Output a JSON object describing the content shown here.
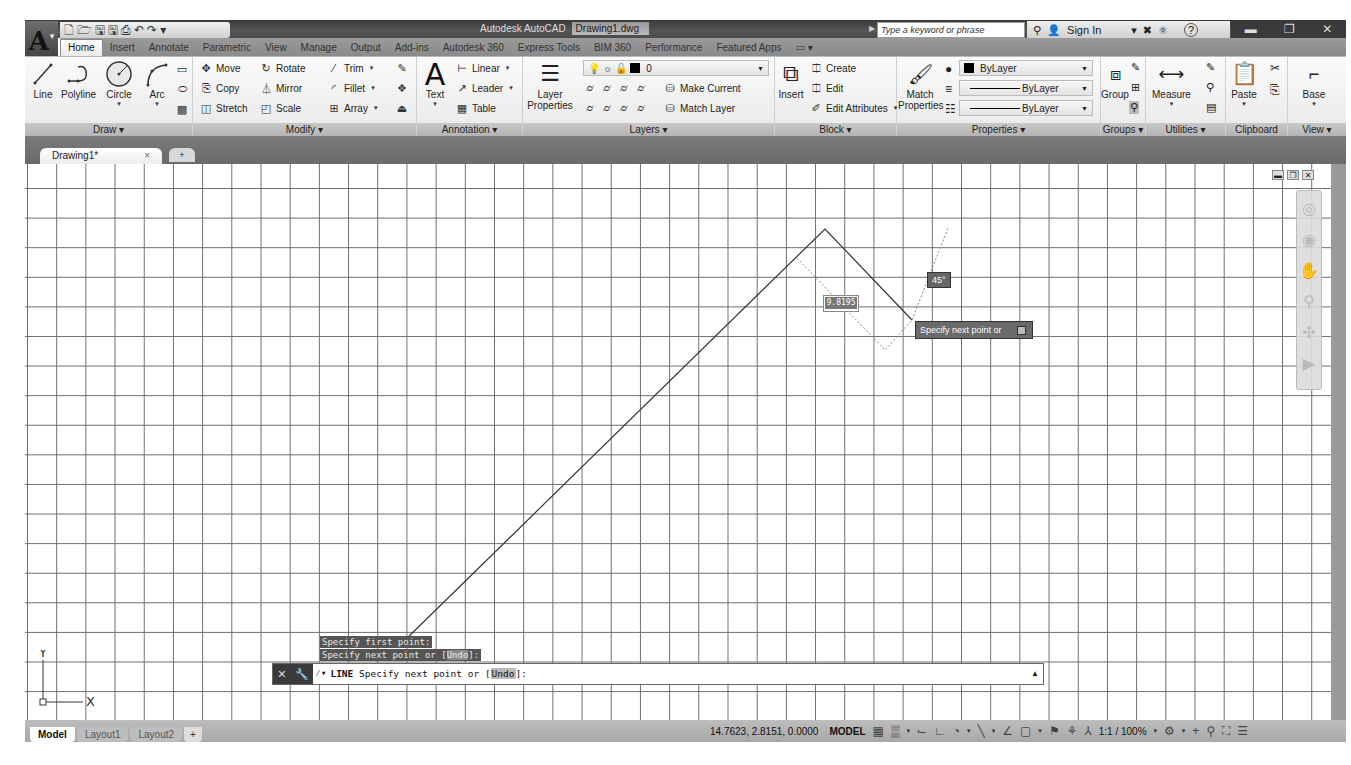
{
  "app": {
    "title": "Autodesk AutoCAD",
    "document": "Drawing1.dwg",
    "logo_letter": "A"
  },
  "quick_access": {
    "icons": [
      "new-icon",
      "open-icon",
      "save-icon",
      "save-as-icon",
      "plot-icon",
      "undo-icon",
      "redo-icon",
      "customize-icon"
    ],
    "glyphs": [
      "🗋",
      "🗁",
      "🖫",
      "🖫",
      "⎙",
      "↶",
      "↷",
      "▾"
    ]
  },
  "search": {
    "placeholder": "Type a keyword or phrase"
  },
  "account": {
    "sign_in": "Sign In",
    "help": "?"
  },
  "ribbon_tabs": [
    "Home",
    "Insert",
    "Annotate",
    "Parametric",
    "View",
    "Manage",
    "Output",
    "Add-ins",
    "Autodesk 360",
    "Express Tools",
    "BIM 360",
    "Performance",
    "Featured Apps"
  ],
  "ribbon": {
    "draw": {
      "title": "Draw ▾",
      "buttons": [
        "Line",
        "Polyline",
        "Circle",
        "Arc"
      ]
    },
    "modify": {
      "title": "Modify ▾",
      "buttons": [
        "Move",
        "Rotate",
        "Trim",
        "Copy",
        "Mirror",
        "Fillet",
        "Stretch",
        "Scale",
        "Array"
      ]
    },
    "annotation": {
      "title": "Annotation ▾",
      "text": "Text",
      "buttons": [
        "Linear",
        "Leader",
        "Table"
      ]
    },
    "layers": {
      "title": "Layers ▾",
      "layer_properties": "Layer Properties",
      "current_layer": "0",
      "make_current": "Make Current",
      "match_layer": "Match Layer"
    },
    "block": {
      "title": "Block ▾",
      "insert": "Insert",
      "buttons": [
        "Create",
        "Edit",
        "Edit Attributes"
      ]
    },
    "properties": {
      "title": "Properties ▾",
      "match_properties": "Match Properties",
      "color": "ByLayer",
      "linetype": "ByLayer",
      "lineweight": "ByLayer"
    },
    "groups": {
      "title": "Groups ▾",
      "group": "Group"
    },
    "utilities": {
      "title": "Utilities ▾",
      "measure": "Measure"
    },
    "clipboard": {
      "title": "Clipboard",
      "paste": "Paste"
    },
    "view": {
      "title": "View ▾",
      "base": "Base"
    }
  },
  "doc_tabs": {
    "active": "Drawing1*",
    "close": "×",
    "new": "+"
  },
  "canvas": {
    "dynamic_input_value": "9.8195",
    "angle": "45°",
    "tooltip": "Specify next point or",
    "line_points": [
      [
        400,
        645
      ],
      [
        825,
        229
      ],
      [
        912,
        320
      ]
    ]
  },
  "command": {
    "history": [
      {
        "text": "Specify first point:"
      },
      {
        "text": "Specify next point or [",
        "option": "Undo",
        "suffix": "]:"
      }
    ],
    "current": {
      "command": "LINE",
      "prompt": "Specify next point or [",
      "option": "Undo",
      "suffix": "]:"
    }
  },
  "ucs": {
    "x": "X",
    "y": "Y"
  },
  "layout_tabs": [
    "Model",
    "Layout1",
    "Layout2"
  ],
  "status": {
    "coordinates": "14.7623, 2.8151, 0.0000",
    "space": "MODEL",
    "annotation_scale": "1:1 / 100%"
  }
}
